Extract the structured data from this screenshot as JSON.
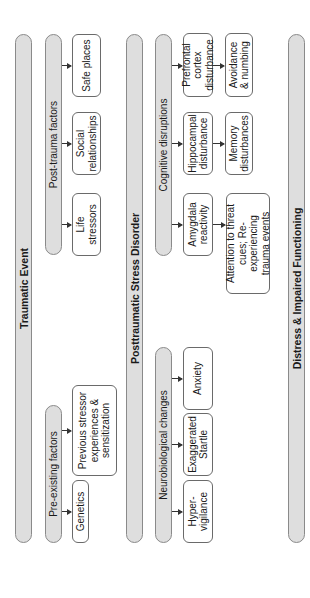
{
  "diagram": {
    "main_bars": {
      "traumatic_event": "Traumatic Event",
      "ptsd": "Posttraumatic Stress Disorder",
      "distress": "Distress & Impaired Functioning"
    },
    "sub_bars": {
      "pre_existing": "Pre-existing factors",
      "post_trauma": "Post-trauma factors",
      "neurobiological": "Neurobiological changes",
      "cognitive": "Cognitive disruptions"
    },
    "boxes": {
      "genetics": "Genetics",
      "previous_stressor": "Previous stressor\nexperiences &\nsensitization",
      "life_stressors": "Life stressors",
      "social_relationships": "Social\nrelationships",
      "safe_places": "Safe places",
      "hypervigilance": "Hyper-\nvigilance",
      "exaggerated_startle": "Exaggerated\nStartle",
      "anxiety": "Anxiety",
      "amygdala": "Amygdala\nreactivity",
      "attention": "Attention to threat\ncues; Re-experiencing\ntrauma events",
      "hippocampal": "Hippocampal\ndisturbance",
      "memory": "Memory\ndisturbances",
      "prefrontal": "Prefrontal cortex\ndisturbance",
      "avoidance": "Avoidance\n& numbing"
    },
    "colors": {
      "bar_fill": "#dedede",
      "bar_border": "#8a8a8a",
      "box_border": "#6a6a6a",
      "arrow": "#333333"
    },
    "orientation": "rotated 90deg counter-clockwise"
  }
}
